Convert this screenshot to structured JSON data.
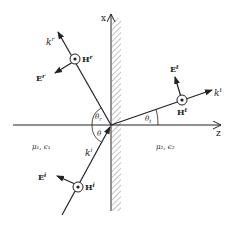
{
  "diagram": {
    "axes": {
      "x_label": "x",
      "z_label": "z"
    },
    "regions": {
      "medium1_label": "μ₁, ϵ₁",
      "medium2_label": "μ₂, ϵ₂"
    },
    "angles": {
      "incident": "θ",
      "reflected": "θr",
      "transmitted": "θt"
    },
    "reflected_wave": {
      "k_label": "k",
      "k_sup": "r",
      "E_label": "E",
      "E_sup": "r",
      "H_label": "H",
      "H_sup": "r"
    },
    "transmitted_wave": {
      "k_label": "k",
      "k_sup": "t",
      "E_label": "E",
      "E_sup": "t",
      "H_label": "H",
      "H_sup": "t"
    },
    "incident_wave": {
      "k_label": "k",
      "k_sup": "i",
      "E_label": "E",
      "E_sup": "i",
      "H_label": "H",
      "H_sup": "i"
    }
  },
  "colors": {
    "stroke": "#222222",
    "hatch": "#777777",
    "background": "#ffffff"
  }
}
